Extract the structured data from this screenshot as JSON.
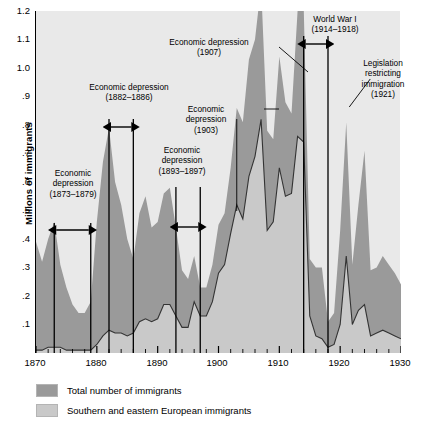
{
  "chart_data": {
    "type": "area",
    "title": "",
    "xlabel": "",
    "ylabel": "Millions of immigrants",
    "xlim": [
      1870,
      1930
    ],
    "ylim": [
      0,
      1.2
    ],
    "grid": false,
    "legend_position": "below-plot",
    "y_ticks": [
      "1.2",
      "1.1",
      "1.0",
      ".9",
      ".8",
      ".7",
      ".6",
      ".5",
      ".4",
      ".3",
      ".2",
      ".1"
    ],
    "y_tick_values": [
      1.2,
      1.1,
      1.0,
      0.9,
      0.8,
      0.7,
      0.6,
      0.5,
      0.4,
      0.3,
      0.2,
      0.1
    ],
    "x_ticks": [
      "1870",
      "1880",
      "1890",
      "1900",
      "1910",
      "1920",
      "1930"
    ],
    "x_tick_values": [
      1870,
      1880,
      1890,
      1900,
      1910,
      1920,
      1930
    ],
    "x_minor_step": 2,
    "x": [
      1870,
      1871,
      1872,
      1873,
      1874,
      1875,
      1876,
      1877,
      1878,
      1879,
      1880,
      1881,
      1882,
      1883,
      1884,
      1885,
      1886,
      1887,
      1888,
      1889,
      1890,
      1891,
      1892,
      1893,
      1894,
      1895,
      1896,
      1897,
      1898,
      1899,
      1900,
      1901,
      1902,
      1903,
      1904,
      1905,
      1906,
      1907,
      1908,
      1909,
      1910,
      1911,
      1912,
      1913,
      1914,
      1915,
      1916,
      1917,
      1918,
      1919,
      1920,
      1921,
      1922,
      1923,
      1924,
      1925,
      1926,
      1927,
      1928,
      1929,
      1930
    ],
    "series": [
      {
        "name": "Total number of immigrants",
        "color": "#9a9a9a",
        "style": "filled-area",
        "values": [
          0.39,
          0.32,
          0.4,
          0.46,
          0.31,
          0.23,
          0.17,
          0.14,
          0.14,
          0.18,
          0.46,
          0.67,
          0.79,
          0.6,
          0.52,
          0.4,
          0.33,
          0.49,
          0.55,
          0.44,
          0.46,
          0.56,
          0.58,
          0.44,
          0.29,
          0.26,
          0.34,
          0.23,
          0.23,
          0.31,
          0.45,
          0.49,
          0.65,
          0.86,
          0.81,
          1.03,
          1.1,
          1.29,
          0.78,
          0.75,
          1.04,
          0.88,
          0.84,
          1.2,
          1.22,
          0.33,
          0.3,
          0.3,
          0.11,
          0.14,
          0.43,
          0.81,
          0.31,
          0.52,
          0.71,
          0.29,
          0.3,
          0.34,
          0.31,
          0.28,
          0.24
        ]
      },
      {
        "name": "Southern and eastern European immigrants",
        "color": "#c9c9c9",
        "style": "line",
        "line_color": "#333333",
        "values": [
          0.01,
          0.01,
          0.02,
          0.02,
          0.02,
          0.01,
          0.01,
          0.01,
          0.01,
          0.01,
          0.03,
          0.06,
          0.08,
          0.07,
          0.07,
          0.06,
          0.07,
          0.11,
          0.12,
          0.11,
          0.12,
          0.17,
          0.17,
          0.13,
          0.09,
          0.09,
          0.18,
          0.13,
          0.13,
          0.18,
          0.28,
          0.31,
          0.42,
          0.52,
          0.47,
          0.62,
          0.69,
          0.82,
          0.43,
          0.46,
          0.65,
          0.55,
          0.56,
          0.76,
          0.74,
          0.13,
          0.06,
          0.05,
          0.02,
          0.03,
          0.1,
          0.34,
          0.1,
          0.15,
          0.17,
          0.06,
          0.07,
          0.08,
          0.07,
          0.06,
          0.05
        ]
      }
    ],
    "annotations": [
      {
        "id": "dep-1873",
        "text": "Economic\ndepression\n(1873–1879)",
        "span_start": 1873,
        "span_end": 1879,
        "marker": "span-arrow"
      },
      {
        "id": "dep-1882",
        "text": "Economic depression\n(1882–1886)",
        "span_start": 1882,
        "span_end": 1886,
        "marker": "span-arrow"
      },
      {
        "id": "dep-1893",
        "text": "Economic\ndepression\n(1893–1897)",
        "span_start": 1893,
        "span_end": 1897,
        "marker": "span-arrow"
      },
      {
        "id": "dep-1903",
        "text": "Economic\ndepression\n(1903)",
        "point": 1903,
        "marker": "leader-line"
      },
      {
        "id": "dep-1907",
        "text": "Economic depression\n(1907)",
        "point": 1907,
        "marker": "leader-line"
      },
      {
        "id": "wwi",
        "text": "World War I\n(1914–1918)",
        "span_start": 1914,
        "span_end": 1918,
        "marker": "span-arrow"
      },
      {
        "id": "legislation-1921",
        "text": "Legislation\nrestricting\nimmigration\n(1921)",
        "point": 1921,
        "marker": "leader-line"
      }
    ]
  },
  "legend": {
    "items": [
      {
        "label": "Total number of immigrants",
        "color": "#9a9a9a"
      },
      {
        "label": "Southern and eastern European immigrants",
        "color": "#c9c9c9"
      }
    ]
  },
  "colors": {
    "plot_background": "#e9e9e9",
    "total_area": "#9a9a9a",
    "southern_eastern_area": "#c9c9c9",
    "line": "#333333",
    "axis": "#000000"
  }
}
